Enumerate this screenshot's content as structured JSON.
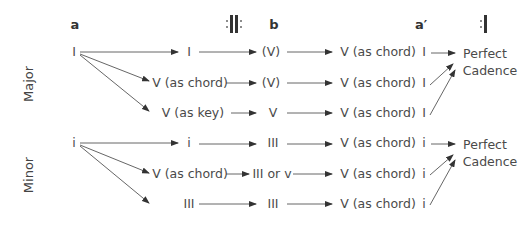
{
  "headers": {
    "a": "a",
    "b": "b",
    "a_prime": "a′"
  },
  "repeat_signs": [
    "start-repeat",
    "end-repeat"
  ],
  "sections": [
    {
      "name": "Major",
      "start": "I",
      "rows": [
        {
          "c1": "I",
          "c2": "(V)",
          "c3": "V (as chord)",
          "c4": "I"
        },
        {
          "c1": "V (as chord)",
          "c2": "(V)",
          "c3": "V (as chord)",
          "c4": "I"
        },
        {
          "c1": "V (as key)",
          "c2": "V",
          "c3": "V (as chord)",
          "c4": "I"
        }
      ],
      "outcome_line1": "Perfect",
      "outcome_line2": "Cadence"
    },
    {
      "name": "Minor",
      "start": "i",
      "rows": [
        {
          "c1": "i",
          "c2": "III",
          "c3": "V (as chord)",
          "c4": "i"
        },
        {
          "c1": "V (as chord)",
          "c2": "III or v",
          "c3": "V (as chord)",
          "c4": "i"
        },
        {
          "c1": "III",
          "c2": "III",
          "c3": "V (as chord)",
          "c4": "i"
        }
      ],
      "outcome_line1": "Perfect",
      "outcome_line2": "Cadence"
    }
  ]
}
